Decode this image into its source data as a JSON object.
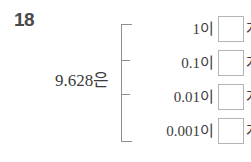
{
  "problem": {
    "number": "18",
    "subject": "9.628은"
  },
  "bracket": {
    "tick_count": 4
  },
  "rows": [
    {
      "label": "1이",
      "value": "",
      "unit": "개"
    },
    {
      "label": "0.1이",
      "value": "",
      "unit": "개"
    },
    {
      "label": "0.01이",
      "value": "",
      "unit": "개"
    },
    {
      "label": "0.001이",
      "value": "",
      "unit": "개"
    }
  ],
  "colors": {
    "text": "#3c3c3c",
    "number": "#4a4a4a",
    "rule": "#8e8e8e",
    "box_border": "#b4b4b4",
    "background": "#ffffff"
  }
}
